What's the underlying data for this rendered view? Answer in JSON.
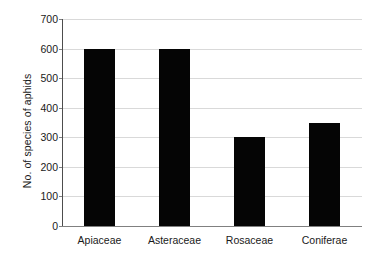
{
  "chart_data": {
    "type": "bar",
    "title": "",
    "xlabel": "",
    "ylabel": "No. of species of aphids",
    "categories": [
      "Apiaceae",
      "Asteraceae",
      "Rosaceae",
      "Coniferae"
    ],
    "values": [
      600,
      600,
      300,
      350
    ],
    "series": [
      {
        "name": "No. of species of aphids",
        "values": [
          600,
          600,
          300,
          350
        ]
      }
    ],
    "ylim": [
      0,
      700
    ],
    "yticks": [
      0,
      100,
      200,
      300,
      400,
      500,
      600,
      700
    ],
    "ytick_labels": [
      "0",
      "100",
      "200",
      "300",
      "400",
      "500",
      "600",
      "700"
    ],
    "grid": "horizontal",
    "legend": "none",
    "bar_color": "#050505",
    "gridline_color": "#d9d9d9",
    "axis_color": "#4d4d4d",
    "background_color": "#ffffff"
  }
}
